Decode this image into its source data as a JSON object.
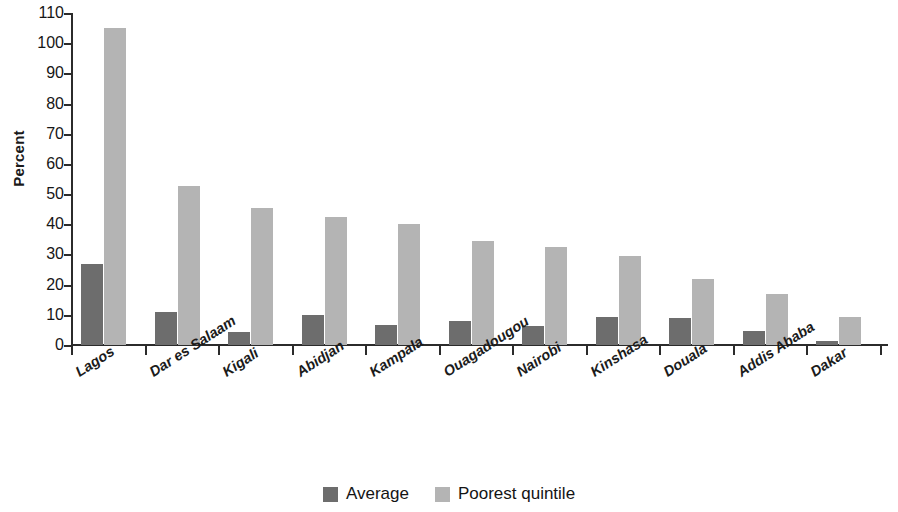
{
  "chart_data": {
    "type": "bar",
    "title": "",
    "xlabel": "",
    "ylabel": "Percent",
    "ylim": [
      0,
      110
    ],
    "yticks": [
      0,
      10,
      20,
      30,
      40,
      50,
      60,
      70,
      80,
      90,
      100,
      110
    ],
    "grid": false,
    "legend_position": "bottom-center",
    "categories": [
      "Lagos",
      "Dar es Salaam",
      "Kigali",
      "Abidjan",
      "Kampala",
      "Ouagadougou",
      "Nairobi",
      "Kinshasa",
      "Douala",
      "Addis Ababa",
      "Dakar"
    ],
    "series": [
      {
        "name": "Average",
        "color": "#6d6d6d",
        "values": [
          27,
          11,
          4.3,
          9.8,
          6.6,
          7.8,
          6.3,
          9.2,
          8.9,
          4.5,
          1.3
        ]
      },
      {
        "name": "Poorest quintile",
        "color": "#b4b4b4",
        "values": [
          105,
          52.8,
          45.3,
          42.3,
          40.2,
          34.3,
          32.4,
          29.5,
          21.8,
          16.8,
          9.4
        ]
      }
    ]
  },
  "legend": {
    "items": [
      {
        "label": "Average",
        "swatch": "avg"
      },
      {
        "label": "Poorest quintile",
        "swatch": "poor"
      }
    ]
  }
}
